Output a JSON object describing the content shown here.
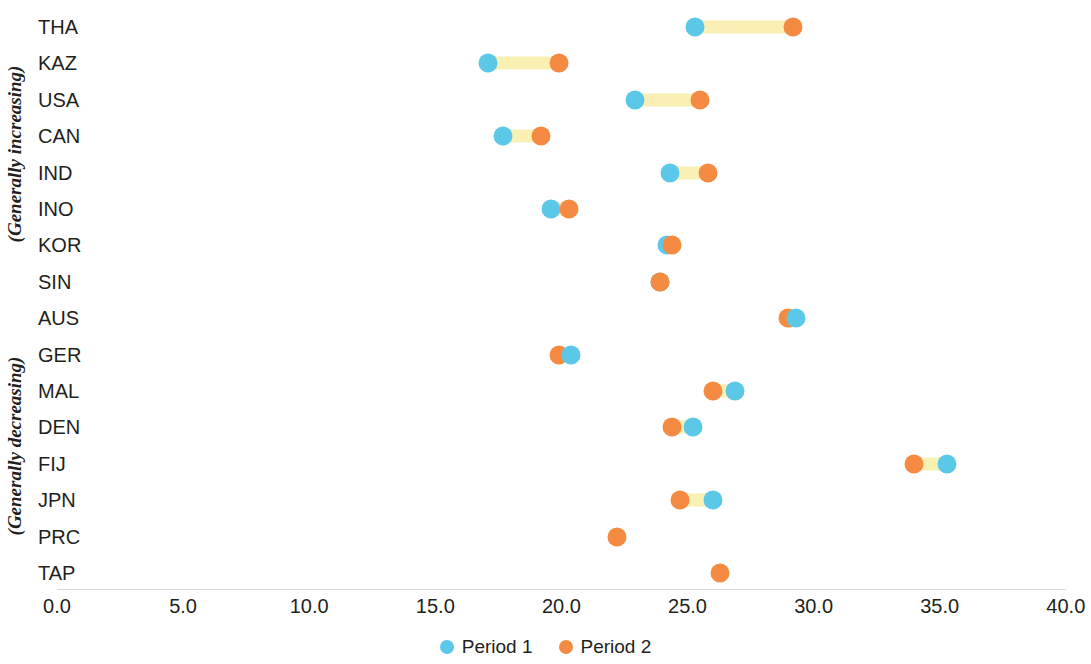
{
  "chart_data": {
    "type": "scatter",
    "subtype": "dumbbell-dot-plot",
    "title": "",
    "xlabel": "",
    "ylabel": "",
    "xlim": [
      0.0,
      40.0
    ],
    "xticks": [
      "0.0",
      "5.0",
      "10.0",
      "15.0",
      "20.0",
      "25.0",
      "30.0",
      "35.0",
      "40.0"
    ],
    "xtick_values": [
      0,
      5,
      10,
      15,
      20,
      25,
      30,
      35,
      40
    ],
    "grid": false,
    "legend_position": "bottom-center",
    "series": [
      {
        "name": "Period 1",
        "color": "#5bc8e8",
        "values": [
          25.3,
          17.1,
          22.9,
          17.7,
          24.3,
          19.6,
          24.2,
          23.9,
          29.3,
          20.4,
          26.9,
          25.2,
          35.3,
          26.0,
          null,
          null
        ]
      },
      {
        "name": "Period 2",
        "color": "#f58b42",
        "values": [
          29.2,
          19.9,
          25.5,
          19.2,
          25.8,
          20.3,
          24.4,
          23.9,
          29.0,
          19.9,
          26.0,
          24.4,
          34.0,
          24.7,
          22.2,
          26.3
        ]
      }
    ],
    "categories": [
      "THA",
      "KAZ",
      "USA",
      "CAN",
      "IND",
      "INO",
      "KOR",
      "SIN",
      "AUS",
      "GER",
      "MAL",
      "DEN",
      "FIJ",
      "JPN",
      "PRC",
      "TAP"
    ],
    "connector_color": "#faf0b4",
    "groups": [
      {
        "label": "(Generally increasing)",
        "categories": [
          "THA",
          "KAZ",
          "USA",
          "CAN",
          "IND",
          "INO",
          "KOR",
          "SIN"
        ]
      },
      {
        "label": "(Generally decreasing)",
        "categories": [
          "AUS",
          "GER",
          "MAL",
          "DEN",
          "FIJ",
          "JPN",
          "PRC",
          "TAP"
        ]
      }
    ]
  },
  "axis": {
    "x_ticks": [
      {
        "label": "0.0",
        "value": 0
      },
      {
        "label": "5.0",
        "value": 5
      },
      {
        "label": "10.0",
        "value": 10
      },
      {
        "label": "15.0",
        "value": 15
      },
      {
        "label": "20.0",
        "value": 20
      },
      {
        "label": "25.0",
        "value": 25
      },
      {
        "label": "30.0",
        "value": 30
      },
      {
        "label": "35.0",
        "value": 35
      },
      {
        "label": "40.0",
        "value": 40
      }
    ]
  },
  "legend": {
    "items": [
      {
        "label": "Period 1",
        "color": "#5bc8e8"
      },
      {
        "label": "Period 2",
        "color": "#f58b42"
      }
    ]
  },
  "colors": {
    "period1": "#5bc8e8",
    "period2": "#f58b42",
    "connector": "#faf0b4",
    "text": "#231f20",
    "axis_line": "#d9d9d9",
    "background": "#ffffff"
  }
}
